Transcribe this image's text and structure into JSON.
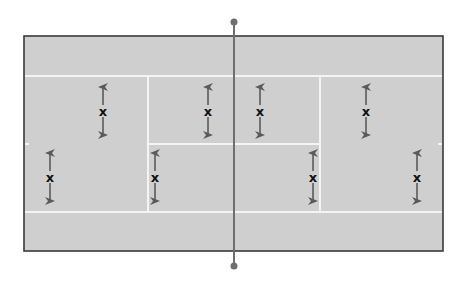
{
  "diagram": {
    "type": "tennis-court-positioning",
    "colors": {
      "background": "#ffffff",
      "court_fill": "#cfcfcf",
      "court_border": "#3a3a3a",
      "court_lines": "#f4f4f4",
      "net": "#6e6e6e",
      "arrow": "#5a5a5a",
      "marker_text": "#111111"
    },
    "court": {
      "x": 24,
      "y": 36,
      "width": 419,
      "height": 215
    },
    "lines": {
      "sideline_top_y": 76,
      "sideline_bottom_y": 212,
      "service_line_left_x": 148,
      "service_line_right_x": 320,
      "center_service_line_y": 144
    },
    "net": {
      "x": 234,
      "y_top": 22,
      "y_bottom": 266,
      "post_radius": 3.5
    },
    "players": [
      {
        "label": "x",
        "x": 103,
        "y": 111,
        "movement": "vertical-double-arrow"
      },
      {
        "label": "x",
        "x": 208,
        "y": 111,
        "movement": "vertical-double-arrow"
      },
      {
        "label": "x",
        "x": 260,
        "y": 111,
        "movement": "vertical-double-arrow"
      },
      {
        "label": "x",
        "x": 366,
        "y": 111,
        "movement": "vertical-double-arrow"
      },
      {
        "label": "x",
        "x": 50,
        "y": 177,
        "movement": "vertical-double-arrow"
      },
      {
        "label": "x",
        "x": 155,
        "y": 177,
        "movement": "vertical-double-arrow"
      },
      {
        "label": "x",
        "x": 313,
        "y": 177,
        "movement": "vertical-double-arrow"
      },
      {
        "label": "x",
        "x": 417,
        "y": 177,
        "movement": "vertical-double-arrow"
      }
    ]
  }
}
